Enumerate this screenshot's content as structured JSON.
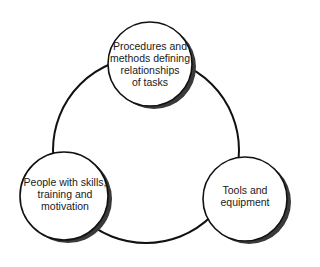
{
  "diagram": {
    "type": "cycle",
    "ring": {
      "cx": 146,
      "cy": 150,
      "r": 93,
      "stroke": "#111111"
    },
    "nodes": [
      {
        "id": "procedures",
        "label": "Procedures and\nmethods defining\nrelationships\nof tasks",
        "cx": 150,
        "cy": 64,
        "r": 42
      },
      {
        "id": "people",
        "label": "People with skills,\ntraining and\nmotivation",
        "cx": 64,
        "cy": 196,
        "r": 44
      },
      {
        "id": "tools",
        "label": "Tools and\nequipment",
        "cx": 245,
        "cy": 199,
        "r": 42
      }
    ],
    "colors": {
      "background": "#ffffff",
      "node_fill": "#ffffff",
      "node_stroke": "#111111",
      "shadow": "#3a3a3a",
      "text": "#1a1a1a"
    }
  }
}
